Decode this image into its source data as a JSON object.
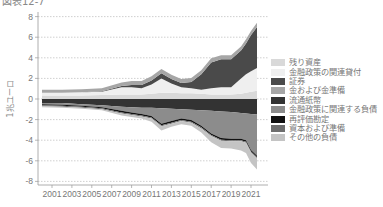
{
  "title": "図表12-7",
  "chart_data": {
    "type": "area",
    "title": "図表12-7",
    "xlabel": "",
    "ylabel": "1兆ユーロ",
    "ylim": [
      -8,
      8
    ],
    "xlim": [
      2000,
      2021.8
    ],
    "grid": true,
    "legend_position": "right",
    "x_ticks": [
      "2001",
      "2003",
      "2005",
      "2007",
      "2009",
      "2011",
      "2013",
      "2015",
      "2017",
      "2019",
      "2021"
    ],
    "y_ticks": [
      "8",
      "6",
      "4",
      "2",
      "0",
      "-2",
      "-4",
      "-6",
      "-8"
    ],
    "x": [
      2000,
      2002,
      2004,
      2006,
      2008,
      2009,
      2010,
      2011,
      2012,
      2013,
      2014,
      2015,
      2016,
      2017,
      2018,
      2019,
      2020,
      2020.5,
      2021,
      2021.6
    ],
    "series": [
      {
        "name": "残り資産",
        "color": "#d9d9d9",
        "side": "asset",
        "values": [
          0.35,
          0.35,
          0.35,
          0.4,
          0.45,
          0.45,
          0.45,
          0.5,
          0.6,
          0.6,
          0.55,
          0.55,
          0.5,
          0.45,
          0.45,
          0.45,
          0.5,
          0.6,
          0.7,
          0.8
        ]
      },
      {
        "name": "金融政策の関連貸付",
        "color": "#efefef",
        "side": "asset",
        "values": [
          0.25,
          0.25,
          0.3,
          0.3,
          0.7,
          0.7,
          0.6,
          0.9,
          1.4,
          0.9,
          0.6,
          0.5,
          0.4,
          0.6,
          0.7,
          0.7,
          1.5,
          1.8,
          2.0,
          2.2
        ]
      },
      {
        "name": "証券",
        "color": "#4a4a4a",
        "side": "asset",
        "values": [
          0.0,
          0.0,
          0.0,
          0.05,
          0.1,
          0.2,
          0.3,
          0.4,
          0.5,
          0.45,
          0.4,
          0.6,
          1.5,
          2.5,
          2.7,
          2.7,
          2.7,
          3.0,
          3.5,
          4.0
        ]
      },
      {
        "name": "金および金準備",
        "color": "#a6a6a6",
        "side": "asset",
        "values": [
          0.3,
          0.3,
          0.3,
          0.3,
          0.35,
          0.4,
          0.4,
          0.4,
          0.4,
          0.4,
          0.4,
          0.4,
          0.4,
          0.4,
          0.4,
          0.4,
          0.4,
          0.4,
          0.4,
          0.4
        ]
      },
      {
        "name": "流通紙幣",
        "color": "#333333",
        "side": "liability",
        "values": [
          -0.4,
          -0.4,
          -0.5,
          -0.6,
          -0.75,
          -0.8,
          -0.85,
          -0.85,
          -0.9,
          -0.95,
          -1.0,
          -1.05,
          -1.1,
          -1.15,
          -1.2,
          -1.25,
          -1.35,
          -1.4,
          -1.45,
          -1.5
        ]
      },
      {
        "name": "金融政策に関連する負債",
        "color": "#8c8c8c",
        "side": "liability",
        "values": [
          -0.1,
          -0.15,
          -0.15,
          -0.2,
          -0.4,
          -0.5,
          -0.6,
          -0.8,
          -1.5,
          -1.2,
          -0.9,
          -1.0,
          -1.5,
          -2.2,
          -2.6,
          -2.6,
          -2.5,
          -2.6,
          -3.5,
          -4.0
        ]
      },
      {
        "name": "再評価勘定",
        "color": "#111111",
        "side": "liability",
        "values": [
          -0.1,
          -0.1,
          -0.1,
          -0.1,
          -0.15,
          -0.15,
          -0.15,
          -0.15,
          -0.15,
          -0.15,
          -0.15,
          -0.15,
          -0.15,
          -0.15,
          -0.15,
          -0.15,
          -0.15,
          -0.15,
          -0.15,
          -0.15
        ]
      },
      {
        "name": "資本および準備",
        "color": "#6e6e6e",
        "side": "liability",
        "values": [
          -0.1,
          -0.1,
          -0.1,
          -0.1,
          -0.1,
          -0.1,
          -0.1,
          -0.1,
          -0.1,
          -0.1,
          -0.1,
          -0.1,
          -0.1,
          -0.1,
          -0.1,
          -0.1,
          -0.1,
          -0.1,
          -0.1,
          -0.1
        ]
      },
      {
        "name": "その他の負債",
        "color": "#c4c4c4",
        "side": "liability",
        "values": [
          -0.1,
          -0.1,
          -0.1,
          -0.1,
          -0.2,
          -0.2,
          -0.2,
          -0.3,
          -0.4,
          -0.3,
          -0.3,
          -0.3,
          -0.4,
          -0.6,
          -0.7,
          -0.7,
          -0.9,
          -1.0,
          -1.0,
          -1.1
        ]
      }
    ]
  }
}
